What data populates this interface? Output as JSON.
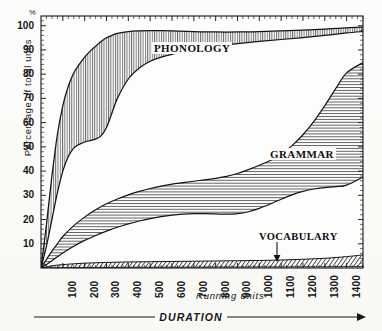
{
  "chart_data": {
    "type": "area",
    "title": "",
    "subtitle": "",
    "xlabel": "Running units",
    "xlabel_secondary": "DURATION",
    "ylabel": "Percentage of total units",
    "y_unit_mark": "%",
    "xlim": [
      0,
      1475
    ],
    "ylim": [
      0,
      104
    ],
    "grid": false,
    "legend_position": "inline-annotations",
    "x_tick_labels": [
      "100",
      "200",
      "300",
      "400",
      "500",
      "600",
      "700",
      "800",
      "900",
      "1000",
      "1100",
      "1200",
      "1300",
      "1400"
    ],
    "x_tick_values": [
      100,
      200,
      300,
      400,
      500,
      600,
      700,
      800,
      900,
      1000,
      1100,
      1200,
      1300,
      1400
    ],
    "y_tick_labels": [
      "10",
      "20",
      "30",
      "40",
      "50",
      "60",
      "70",
      "80",
      "90",
      "100"
    ],
    "y_tick_values": [
      10,
      20,
      30,
      40,
      50,
      60,
      70,
      80,
      90,
      100
    ],
    "stacking": "band",
    "annotations": [
      {
        "text": "PHONOLOGY",
        "band": "phonology",
        "x": 560,
        "y": 93
      },
      {
        "text": "GRAMMAR",
        "band": "grammar",
        "x": 1090,
        "y": 45
      },
      {
        "text": "VOCABULARY",
        "band": "vocabulary",
        "x": 1050,
        "y": 16,
        "arrow": true,
        "arrow_target_y": 4
      }
    ],
    "series": [
      {
        "name": "PHONOLOGY",
        "hatch": "vertical",
        "x": [
          0,
          25,
          50,
          75,
          100,
          125,
          150,
          175,
          200,
          225,
          250,
          275,
          300,
          325,
          350,
          400,
          450,
          500,
          550,
          600,
          700,
          800,
          900,
          1000,
          1100,
          1200,
          1300,
          1400,
          1475
        ],
        "upper": [
          0,
          18,
          38,
          55,
          67,
          75,
          80.5,
          84,
          87,
          89.5,
          91.5,
          93.5,
          95,
          96,
          96.8,
          97.6,
          97.9,
          98,
          98,
          97.9,
          97.6,
          97.4,
          97.4,
          97.6,
          97.9,
          98.2,
          98.6,
          99.1,
          99.4
        ],
        "lower": [
          0,
          9,
          20,
          31,
          40,
          46,
          49.5,
          51,
          52,
          52.6,
          53.2,
          54.5,
          58,
          64,
          70,
          78,
          82.5,
          85.3,
          87,
          88.2,
          90.2,
          91.6,
          92.6,
          93.5,
          94.3,
          95.1,
          96,
          97,
          97.6
        ]
      },
      {
        "name": "GRAMMAR",
        "hatch": "horizontal",
        "x": [
          0,
          25,
          50,
          75,
          100,
          150,
          200,
          250,
          300,
          350,
          400,
          450,
          500,
          550,
          600,
          650,
          700,
          750,
          800,
          850,
          900,
          950,
          1000,
          1050,
          1100,
          1150,
          1200,
          1250,
          1300,
          1350,
          1400,
          1475
        ],
        "upper": [
          0,
          3.5,
          7,
          10,
          13,
          17.5,
          21,
          24,
          26.5,
          28.5,
          30.2,
          31.6,
          32.8,
          33.8,
          34.6,
          35.2,
          35.8,
          36.4,
          37,
          37.8,
          39,
          40.6,
          42.4,
          44.4,
          47,
          50.5,
          55,
          60.5,
          67,
          74,
          80.5,
          84.8
        ],
        "lower": [
          0,
          1.4,
          3,
          4.6,
          6.2,
          9,
          11.4,
          13.4,
          15.2,
          16.8,
          18.2,
          19.4,
          20.4,
          21.2,
          21.8,
          22.2,
          22.4,
          22.4,
          22.3,
          22.2,
          22.4,
          23.2,
          24.6,
          26.4,
          28.4,
          30.2,
          31.6,
          32.6,
          33.2,
          33.6,
          34.2,
          37.5
        ]
      },
      {
        "name": "VOCABULARY",
        "hatch": "diagonal",
        "x": [
          0,
          50,
          100,
          200,
          300,
          400,
          500,
          600,
          700,
          800,
          900,
          1000,
          1100,
          1200,
          1300,
          1400,
          1475
        ],
        "upper": [
          0,
          0.9,
          1.4,
          2.0,
          2.3,
          2.5,
          2.6,
          2.7,
          2.8,
          2.9,
          3.0,
          3.1,
          3.3,
          3.6,
          4.0,
          4.7,
          5.4
        ],
        "lower": [
          0,
          0.1,
          0.15,
          0.2,
          0.25,
          0.3,
          0.3,
          0.35,
          0.35,
          0.4,
          0.4,
          0.45,
          0.45,
          0.5,
          0.5,
          0.55,
          0.6
        ]
      }
    ],
    "colors": {
      "ink": "#15151a",
      "background": "#fbfbf9",
      "hatch": "#2a2a30"
    }
  },
  "axes": {
    "y_title": "Percentage of total units",
    "y_unit": "%",
    "x_title": "Running units",
    "x_title_secondary": "DURATION"
  },
  "labels": {
    "phonology": "PHONOLOGY",
    "grammar": "GRAMMAR",
    "vocabulary": "VOCABULARY"
  }
}
